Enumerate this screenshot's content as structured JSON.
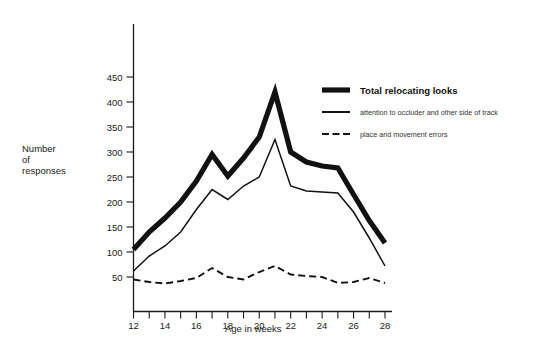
{
  "chart_data": {
    "type": "line",
    "title": "",
    "xlabel": "Age in weeks",
    "ylabel": "Number of responses",
    "ylabel_lines": [
      "Number",
      "of",
      "responses"
    ],
    "xlim": [
      12,
      28
    ],
    "ylim": [
      0,
      490
    ],
    "grid": false,
    "legend_position": "right-top",
    "x": [
      12,
      13,
      14,
      15,
      16,
      17,
      18,
      19,
      20,
      21,
      22,
      23,
      24,
      25,
      26,
      27,
      28
    ],
    "xticks": [
      12,
      13,
      14,
      15,
      16,
      17,
      18,
      19,
      20,
      21,
      22,
      23,
      24,
      25,
      26,
      27,
      28
    ],
    "xtick_labels_shown": [
      12,
      14,
      16,
      18,
      20,
      22,
      24,
      26,
      28
    ],
    "yticks": [
      50,
      100,
      150,
      200,
      250,
      300,
      350,
      400,
      450
    ],
    "ytick_labels": [
      "50",
      "100",
      "150",
      "200",
      "250",
      "300",
      "350",
      "400",
      "450"
    ],
    "series": [
      {
        "name": "Total relocating looks",
        "style": "thick-solid",
        "values": [
          105,
          140,
          168,
          200,
          242,
          295,
          252,
          288,
          330,
          420,
          300,
          280,
          272,
          268,
          215,
          163,
          118
        ]
      },
      {
        "name": "attention to occluder and other side of track",
        "style": "thin-solid",
        "values": [
          62,
          92,
          112,
          140,
          185,
          225,
          205,
          232,
          250,
          325,
          232,
          222,
          220,
          218,
          180,
          128,
          72
        ]
      },
      {
        "name": "place and movement errors",
        "style": "dashed",
        "values": [
          45,
          40,
          37,
          42,
          48,
          68,
          50,
          45,
          60,
          72,
          55,
          52,
          50,
          38,
          40,
          48,
          38
        ]
      }
    ]
  },
  "legend": {
    "items": [
      {
        "label": "Total relocating looks",
        "style": "thick-solid",
        "emphasis": "bold"
      },
      {
        "label": "attention to occluder and other side of track",
        "style": "thin-solid",
        "emphasis": "normal"
      },
      {
        "label": "place and movement errors",
        "style": "dashed",
        "emphasis": "normal"
      }
    ]
  }
}
